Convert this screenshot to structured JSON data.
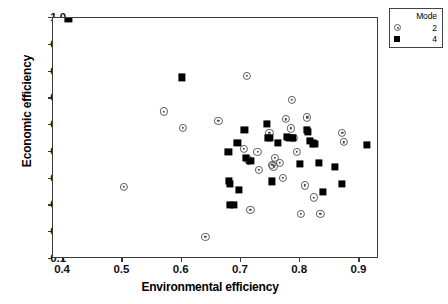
{
  "chart_data": {
    "type": "scatter",
    "title": "",
    "xlabel": "Environmental efficiency",
    "ylabel": "Economic efficiency",
    "xlim": [
      0.383,
      0.933
    ],
    "ylim": [
      0.1,
      1.0
    ],
    "xticks": [
      0.4,
      0.5,
      0.6,
      0.7,
      0.8,
      0.9
    ],
    "xticklabels": [
      "0.4",
      "0.5",
      "0.6",
      "0.7",
      "0.8",
      "0.9"
    ],
    "yticks": [
      0.1,
      0.2,
      0.3,
      0.4,
      0.5,
      0.6,
      0.7,
      0.8,
      0.9,
      1.0
    ],
    "yticklabels": [
      "0.1",
      "0.2",
      "0.3",
      "0.4",
      "0.5",
      "0.6",
      "0.7",
      "0.8",
      "0.9",
      "1.0"
    ],
    "grid": false,
    "legend": {
      "title": "Mode",
      "position": "outside-top-right",
      "entries": [
        {
          "label": "2",
          "marker": "circle-dot",
          "name": "mode-2"
        },
        {
          "label": "4",
          "marker": "filled-square",
          "name": "mode-4"
        }
      ]
    },
    "series": [
      {
        "name": "2",
        "marker": "circle-dot",
        "color": "#5d5d5d",
        "points": [
          [
            0.503,
            0.37
          ],
          [
            0.57,
            0.651
          ],
          [
            0.602,
            0.59
          ],
          [
            0.64,
            0.182
          ],
          [
            0.662,
            0.617
          ],
          [
            0.705,
            0.511
          ],
          [
            0.71,
            0.785
          ],
          [
            0.712,
            0.472
          ],
          [
            0.714,
            0.468
          ],
          [
            0.716,
            0.283
          ],
          [
            0.728,
            0.501
          ],
          [
            0.73,
            0.434
          ],
          [
            0.748,
            0.572
          ],
          [
            0.753,
            0.452
          ],
          [
            0.755,
            0.446
          ],
          [
            0.757,
            0.478
          ],
          [
            0.766,
            0.458
          ],
          [
            0.771,
            0.403
          ],
          [
            0.776,
            0.622
          ],
          [
            0.784,
            0.588
          ],
          [
            0.786,
            0.695
          ],
          [
            0.79,
            0.551
          ],
          [
            0.795,
            0.501
          ],
          [
            0.801,
            0.268
          ],
          [
            0.808,
            0.375
          ],
          [
            0.812,
            0.629
          ],
          [
            0.823,
            0.33
          ],
          [
            0.834,
            0.268
          ],
          [
            0.871,
            0.57
          ],
          [
            0.874,
            0.536
          ]
        ]
      },
      {
        "name": "4",
        "marker": "filled-square",
        "color": "#000000",
        "points": [
          [
            0.409,
            0.997
          ],
          [
            0.601,
            0.778
          ],
          [
            0.679,
            0.499
          ],
          [
            0.68,
            0.392
          ],
          [
            0.681,
            0.381
          ],
          [
            0.682,
            0.301
          ],
          [
            0.688,
            0.302
          ],
          [
            0.694,
            0.535
          ],
          [
            0.697,
            0.357
          ],
          [
            0.706,
            0.582
          ],
          [
            0.709,
            0.478
          ],
          [
            0.716,
            0.467
          ],
          [
            0.744,
            0.605
          ],
          [
            0.746,
            0.553
          ],
          [
            0.749,
            0.552
          ],
          [
            0.752,
            0.39
          ],
          [
            0.763,
            0.535
          ],
          [
            0.778,
            0.556
          ],
          [
            0.782,
            0.552
          ],
          [
            0.788,
            0.551
          ],
          [
            0.8,
            0.455
          ],
          [
            0.811,
            0.583
          ],
          [
            0.813,
            0.576
          ],
          [
            0.817,
            0.541
          ],
          [
            0.821,
            0.532
          ],
          [
            0.824,
            0.53
          ],
          [
            0.832,
            0.458
          ],
          [
            0.838,
            0.352
          ],
          [
            0.858,
            0.443
          ],
          [
            0.871,
            0.381
          ],
          [
            0.912,
            0.527
          ]
        ]
      }
    ]
  }
}
